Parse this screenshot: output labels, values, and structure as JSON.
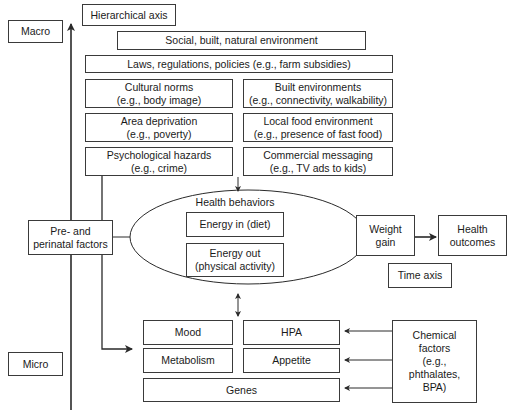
{
  "axes": {
    "macro": "Macro",
    "micro": "Micro",
    "hierarchical": "Hierarchical axis",
    "time": "Time axis"
  },
  "macro_levels": {
    "social_env": "Social, built, natural environment",
    "laws": "Laws, regulations, policies (e.g., farm subsidies)",
    "cultural_norms": {
      "title": "Cultural norms",
      "example": "(e.g., body image)"
    },
    "built_env": {
      "title": "Built environments",
      "example": "(e.g., connectivity, walkability)"
    },
    "area_deprivation": {
      "title": "Area deprivation",
      "example": "(e.g., poverty)"
    },
    "local_food": {
      "title": "Local food environment",
      "example": "(e.g., presence of fast food)"
    },
    "psych_hazards": {
      "title": "Psychological hazards",
      "example": "(e.g., crime)"
    },
    "commercial": {
      "title": "Commercial messaging",
      "example": "(e.g., TV ads to kids)"
    }
  },
  "health_behaviors": {
    "title": "Health behaviors",
    "energy_in": "Energy in (diet)",
    "energy_out": {
      "line1": "Energy out",
      "line2": "(physical activity)"
    }
  },
  "perinatal": {
    "line1": "Pre- and",
    "line2": "perinatal factors"
  },
  "outcomes": {
    "weight_gain": {
      "line1": "Weight",
      "line2": "gain"
    },
    "health_outcomes": {
      "line1": "Health",
      "line2": "outcomes"
    }
  },
  "micro_levels": {
    "mood": "Mood",
    "hpa": "HPA",
    "metabolism": "Metabolism",
    "appetite": "Appetite",
    "genes": "Genes"
  },
  "chemical": {
    "line1": "Chemical",
    "line2": "factors",
    "line3": "(e.g.,",
    "line4": "phthalates,",
    "line5": "BPA)"
  },
  "colors": {
    "line": "#2a2a2a",
    "border": "#3a3a3a",
    "background": "#ffffff"
  }
}
